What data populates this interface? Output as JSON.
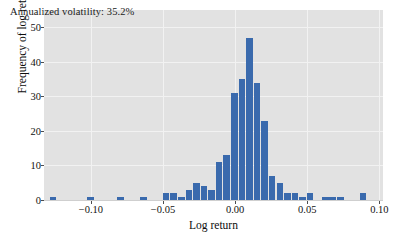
{
  "chart_data": {
    "type": "bar",
    "title": "",
    "annotation": "Annualized volatility: 35.2%",
    "xlabel": "Log return",
    "ylabel": "Frequency of log return",
    "xlim": [
      -0.1325,
      0.1025
    ],
    "ylim": [
      0,
      55
    ],
    "grid": true,
    "legend_position": "none",
    "bar_color": "#3a6aad",
    "plot_background": "#e2e2e2",
    "figure_background": "#ffffff",
    "bin_width": 0.00525,
    "xticks": [
      -0.1,
      -0.05,
      0.0,
      0.05,
      0.1
    ],
    "xticklabels": [
      "−0.10",
      "−0.05",
      "0.00",
      "0.05",
      "0.10"
    ],
    "yticks": [
      0,
      10,
      20,
      30,
      40,
      50
    ],
    "yticklabels": [
      "0",
      "10",
      "20",
      "30",
      "40",
      "50"
    ],
    "bins": [
      {
        "x": -0.126,
        "value": 1
      },
      {
        "x": -0.1,
        "value": 1
      },
      {
        "x": -0.079,
        "value": 1
      },
      {
        "x": -0.0632,
        "value": 1
      },
      {
        "x": -0.0475,
        "value": 2
      },
      {
        "x": -0.0422,
        "value": 2
      },
      {
        "x": -0.037,
        "value": 1
      },
      {
        "x": -0.0317,
        "value": 3
      },
      {
        "x": -0.0265,
        "value": 5
      },
      {
        "x": -0.0212,
        "value": 4
      },
      {
        "x": -0.016,
        "value": 3
      },
      {
        "x": -0.0107,
        "value": 11
      },
      {
        "x": -0.0055,
        "value": 13
      },
      {
        "x": -0.0002,
        "value": 31
      },
      {
        "x": 0.005,
        "value": 35
      },
      {
        "x": 0.0103,
        "value": 47
      },
      {
        "x": 0.0155,
        "value": 34
      },
      {
        "x": 0.0208,
        "value": 23
      },
      {
        "x": 0.026,
        "value": 7
      },
      {
        "x": 0.0313,
        "value": 5
      },
      {
        "x": 0.0365,
        "value": 2
      },
      {
        "x": 0.0418,
        "value": 2
      },
      {
        "x": 0.047,
        "value": 1
      },
      {
        "x": 0.0523,
        "value": 2
      },
      {
        "x": 0.0628,
        "value": 1
      },
      {
        "x": 0.068,
        "value": 1
      },
      {
        "x": 0.0733,
        "value": 1
      },
      {
        "x": 0.089,
        "value": 2
      }
    ]
  }
}
